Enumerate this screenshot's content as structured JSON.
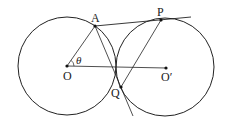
{
  "diagram": {
    "type": "geometry",
    "stroke_color": "#222222",
    "circles": [
      {
        "name": "circle-O",
        "cx": 67,
        "cy": 66,
        "r": 49
      },
      {
        "name": "circle-O-prime",
        "cx": 165,
        "cy": 67,
        "r": 49
      }
    ],
    "points": {
      "O": {
        "label": "O",
        "x": 67,
        "y": 66
      },
      "O_prime": {
        "label": "O′",
        "x": 166,
        "y": 68
      },
      "A": {
        "label": "A",
        "x": 95,
        "y": 26
      },
      "P": {
        "label": "P",
        "x": 161,
        "y": 20
      },
      "Q": {
        "label": "Q",
        "x": 121,
        "y": 87
      }
    },
    "angle_label": "θ",
    "labels": {
      "A": "A",
      "P": "P",
      "O": "O",
      "O_prime": "O′",
      "Q": "Q",
      "theta": "θ"
    }
  }
}
